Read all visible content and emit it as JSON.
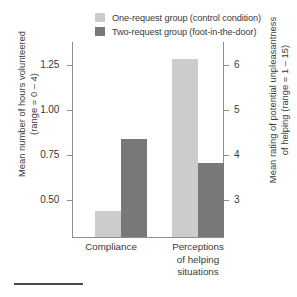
{
  "chart_data": {
    "type": "bar",
    "title": "",
    "subtitle": "",
    "categories": [
      "Compliance",
      "Perceptions\nof helping\nsituations"
    ],
    "category_labels_flat": [
      "Compliance",
      "Perceptions of helping situations"
    ],
    "series": [
      {
        "name": "One-request group (control condition)",
        "color": "#cccccc",
        "values": [
          0.53,
          6.0
        ],
        "axis": [
          "left",
          "right"
        ]
      },
      {
        "name": "Two-request group (foot-in-the-door)",
        "color": "#787878",
        "values": [
          0.885,
          4.0
        ],
        "axis": [
          "left",
          "right"
        ]
      }
    ],
    "left_axis": {
      "label": "Mean number of hours volunteered (range = 0 – 4)",
      "label_line1": "Mean number of hours volunteered",
      "label_line2": "(range = 0 – 4)",
      "ticks": [
        "1.25",
        "1.00",
        "0.75",
        "0.50"
      ],
      "tick_values": [
        1.25,
        1.0,
        0.75,
        0.5
      ],
      "ylim": [
        0.4,
        1.36
      ]
    },
    "right_axis": {
      "label": "Mean rating of potential unpleasantness of helping (range = 1 – 15)",
      "label_line1": "Mean rating of potential unpleasantness",
      "label_line2": "of helping (range = 1 – 15)",
      "ticks": [
        "6",
        "5",
        "4",
        "3"
      ],
      "tick_values": [
        6,
        5,
        4,
        3
      ],
      "ylim": [
        2.58,
        6.32
      ]
    },
    "xlabel": "",
    "grid": false,
    "legend_position": "top"
  },
  "legend": {
    "items": [
      {
        "label": "One-request group (control condition)",
        "color": "#cccccc"
      },
      {
        "label": "Two-request group (foot-in-the-door)",
        "color": "#787878"
      }
    ]
  },
  "colors": {
    "light_bar": "#cccccc",
    "dark_bar": "#787878",
    "axis": "#8d8d8d",
    "text": "#3a3a3a",
    "footer_rule": "#4a4a4a"
  }
}
